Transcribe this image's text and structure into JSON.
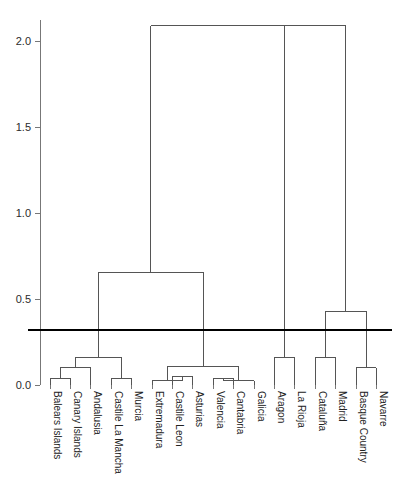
{
  "chart_data": {
    "type": "dendrogram",
    "title": "",
    "xlabel": "",
    "ylabel": "",
    "ylim": [
      0.0,
      2.2
    ],
    "grid": false,
    "legend": null,
    "axis_ticks": [
      {
        "value": 0.0,
        "label": "0.0"
      },
      {
        "value": 0.5,
        "label": "0.5"
      },
      {
        "value": 1.0,
        "label": "1.0"
      },
      {
        "value": 1.5,
        "label": "1.5"
      },
      {
        "value": 2.0,
        "label": "2.0"
      }
    ],
    "cut_line": {
      "value": 0.32,
      "label": ""
    },
    "leaves": [
      "Balears Islands",
      "Canary Islands",
      "Andalusia",
      "Castile La Mancha",
      "Murcia",
      "Extremadura",
      "Castile Leon",
      "Asturias",
      "Valencia",
      "Cantabria",
      "Galicia",
      "Aragon",
      "La Rioja",
      "Cataluña",
      "Madrid",
      "Basque Country",
      "Navarre"
    ],
    "merges": [
      {
        "id": "m1",
        "left": "Balears Islands",
        "right": "Canary Islands",
        "height": 0.04
      },
      {
        "id": "m2",
        "left": "m1",
        "right": "Andalusia",
        "height": 0.1
      },
      {
        "id": "m3",
        "left": "Castile La Mancha",
        "right": "Murcia",
        "height": 0.04
      },
      {
        "id": "m4",
        "left": "m2",
        "right": "m3",
        "height": 0.16
      },
      {
        "id": "m5",
        "left": "Castile Leon",
        "right": "Asturias",
        "height": 0.05
      },
      {
        "id": "m6",
        "left": "Extremadura",
        "right": "m5",
        "height": 0.025
      },
      {
        "id": "m7",
        "left": "Valencia",
        "right": "Cantabria",
        "height": 0.04
      },
      {
        "id": "m8",
        "left": "m7",
        "right": "Galicia",
        "height": 0.025
      },
      {
        "id": "m9",
        "left": "m6",
        "right": "m8",
        "height": 0.11
      },
      {
        "id": "m10",
        "left": "m4",
        "right": "m9",
        "height": 0.655
      },
      {
        "id": "m11",
        "left": "Aragon",
        "right": "La Rioja",
        "height": 0.16
      },
      {
        "id": "m12",
        "left": "Cataluña",
        "right": "Madrid",
        "height": 0.16
      },
      {
        "id": "m13",
        "left": "Basque Country",
        "right": "Navarre",
        "height": 0.1
      },
      {
        "id": "m14",
        "left": "m12",
        "right": "m13",
        "height": 0.43
      },
      {
        "id": "m15",
        "left": "m11",
        "right": "m14",
        "height": 2.09
      },
      {
        "id": "m16",
        "left": "m10",
        "right": "m15",
        "height": 2.09
      }
    ],
    "root": "m16",
    "colors": {
      "line": "#555555",
      "cut_line": "#000000",
      "axis": "#777777",
      "text": "#222222",
      "background": "#ffffff"
    }
  }
}
